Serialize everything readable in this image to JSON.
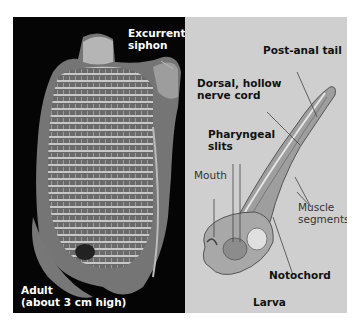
{
  "figure": {
    "panels": [
      {
        "id": "adult",
        "caption_line1": "Adult",
        "caption_line2": "(about 3 cm high)",
        "labels": {
          "excurrent_line1": "Excurrent",
          "excurrent_line2": "siphon"
        },
        "background": "#050505"
      },
      {
        "id": "larva",
        "caption": "Larva",
        "labels": {
          "post_anal_tail": "Post-anal tail",
          "dorsal_line1": "Dorsal, hollow",
          "dorsal_line2": "nerve cord",
          "pharyngeal_line1": "Pharyngeal",
          "pharyngeal_line2": "slits",
          "mouth": "Mouth",
          "muscle_line1": "Muscle",
          "muscle_line2": "segments",
          "notochord": "Notochord"
        },
        "background": "#cfcfcf"
      }
    ]
  }
}
